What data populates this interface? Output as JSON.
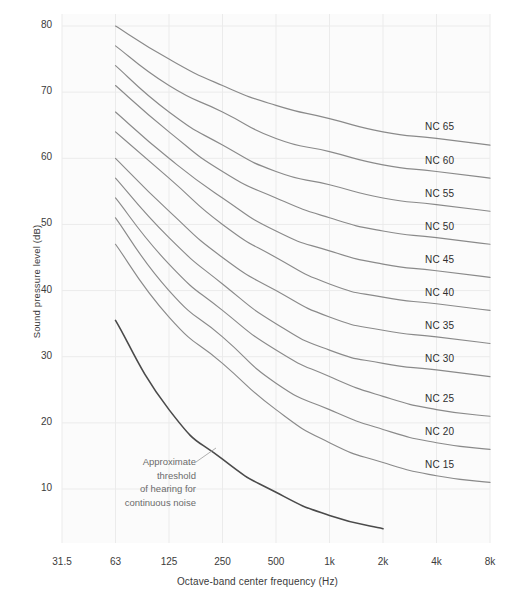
{
  "chart_data": {
    "type": "line",
    "title": "",
    "xlabel": "Octave-band center frequency (Hz)",
    "ylabel": "Sound pressure level (dB)",
    "x_tick_labels": [
      "31.5",
      "63",
      "125",
      "250",
      "500",
      "1k",
      "2k",
      "4k",
      "8k"
    ],
    "x_values": [
      31.5,
      63,
      125,
      250,
      500,
      1000,
      2000,
      4000,
      8000
    ],
    "y_tick_labels": [
      "80",
      "70",
      "60",
      "50",
      "40",
      "30",
      "20",
      "10"
    ],
    "y_values": [
      80,
      70,
      60,
      50,
      40,
      30,
      20,
      10
    ],
    "ylim": [
      2,
      84
    ],
    "grid": true,
    "legend_position": "inline-right",
    "line_color": "#8a8a8a",
    "threshold_color": "#4a4a4a",
    "grid_color": "#ebebeb",
    "plot_bg": "#fbfbfb",
    "series": [
      {
        "name": "NC 65",
        "label": "NC 65",
        "x": [
          63,
          125,
          250,
          500,
          1000,
          2000,
          4000,
          8000
        ],
        "values": [
          80,
          75,
          71,
          68,
          66,
          64,
          63,
          62
        ]
      },
      {
        "name": "NC 60",
        "label": "NC 60",
        "x": [
          63,
          125,
          250,
          500,
          1000,
          2000,
          4000,
          8000
        ],
        "values": [
          77,
          71,
          67,
          63,
          61,
          59,
          58,
          57
        ]
      },
      {
        "name": "NC 55",
        "label": "NC 55",
        "x": [
          63,
          125,
          250,
          500,
          1000,
          2000,
          4000,
          8000
        ],
        "values": [
          74,
          67,
          62,
          58,
          56,
          54,
          53,
          52
        ]
      },
      {
        "name": "NC 50",
        "label": "NC 50",
        "x": [
          63,
          125,
          250,
          500,
          1000,
          2000,
          4000,
          8000
        ],
        "values": [
          71,
          64,
          58,
          54,
          51,
          49,
          48,
          47
        ]
      },
      {
        "name": "NC 45",
        "label": "NC 45",
        "x": [
          63,
          125,
          250,
          500,
          1000,
          2000,
          4000,
          8000
        ],
        "values": [
          67,
          60,
          54,
          49,
          46,
          44,
          43,
          42
        ]
      },
      {
        "name": "NC 40",
        "label": "NC 40",
        "x": [
          63,
          125,
          250,
          500,
          1000,
          2000,
          4000,
          8000
        ],
        "values": [
          64,
          57,
          50,
          45,
          41,
          39,
          38,
          37
        ]
      },
      {
        "name": "NC 35",
        "label": "NC 35",
        "x": [
          63,
          125,
          250,
          500,
          1000,
          2000,
          4000,
          8000
        ],
        "values": [
          60,
          52,
          45,
          40,
          36,
          34,
          33,
          32
        ]
      },
      {
        "name": "NC 30",
        "label": "NC 30",
        "x": [
          63,
          125,
          250,
          500,
          1000,
          2000,
          4000,
          8000
        ],
        "values": [
          57,
          48,
          41,
          35,
          31,
          29,
          28,
          27
        ]
      },
      {
        "name": "NC 25",
        "label": "NC 25",
        "x": [
          63,
          125,
          250,
          500,
          1000,
          2000,
          4000,
          8000
        ],
        "values": [
          54,
          44,
          37,
          31,
          27,
          24,
          22,
          21
        ]
      },
      {
        "name": "NC 20",
        "label": "NC 20",
        "x": [
          63,
          125,
          250,
          500,
          1000,
          2000,
          4000,
          8000
        ],
        "values": [
          51,
          40,
          33,
          26,
          22,
          19,
          17,
          16
        ]
      },
      {
        "name": "NC 15",
        "label": "NC 15",
        "x": [
          63,
          125,
          250,
          500,
          1000,
          2000,
          4000,
          8000
        ],
        "values": [
          47,
          36,
          29,
          22,
          17,
          14,
          12,
          11
        ]
      }
    ],
    "threshold_series": {
      "name": "threshold-of-hearing",
      "x": [
        63,
        125,
        250,
        500,
        1000,
        2000
      ],
      "values": [
        35.5,
        22,
        14.5,
        9.5,
        6,
        4
      ]
    },
    "annotations": [
      {
        "name": "threshold-annotation",
        "text": "Approximate threshold of hearing for continuous noise",
        "lines": [
          "Approximate",
          "threshold",
          "of hearing for",
          "continuous noise"
        ]
      }
    ]
  }
}
